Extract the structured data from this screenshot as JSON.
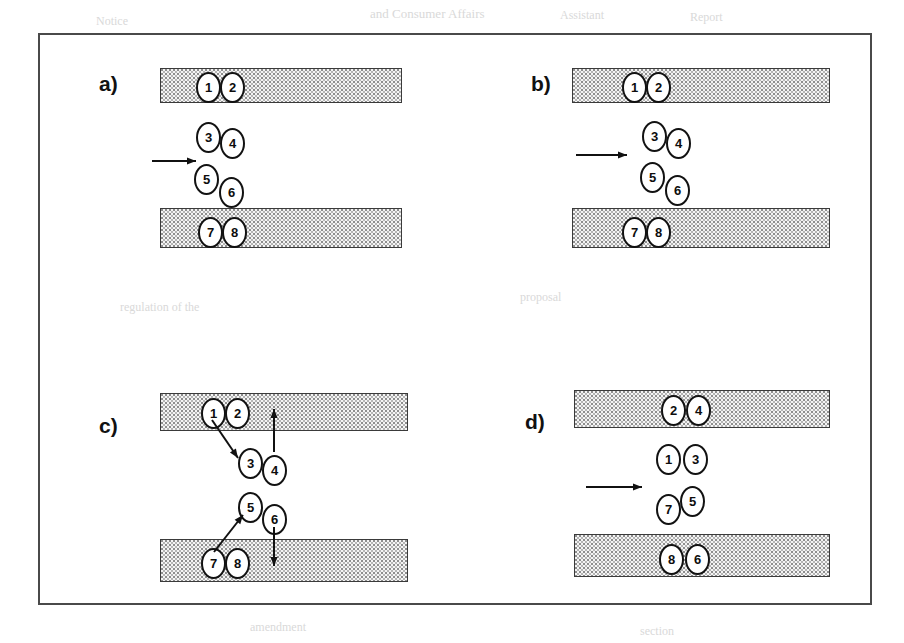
{
  "figure": {
    "type": "schematic-diagram",
    "frame": {
      "x": 38,
      "y": 33,
      "width": 834,
      "height": 572
    }
  },
  "panels": [
    {
      "id": "a",
      "label": "a)",
      "label_pos": {
        "x": 99,
        "y": 72
      },
      "origin": {
        "x": 60,
        "y": 33
      },
      "slabs": [
        {
          "name": "top-slab",
          "x": 160,
          "y": 68,
          "width": 242,
          "height": 35
        },
        {
          "name": "bottom-slab",
          "x": 160,
          "y": 208,
          "width": 242,
          "height": 40
        }
      ],
      "arrow": {
        "name": "shear-arrow",
        "x1": 152,
        "y1": 161,
        "x2": 196,
        "y2": 161
      },
      "nodes": [
        {
          "label": "1",
          "x": 196,
          "y": 72
        },
        {
          "label": "2",
          "x": 220,
          "y": 72
        },
        {
          "label": "3",
          "x": 196,
          "y": 122
        },
        {
          "label": "4",
          "x": 220,
          "y": 128
        },
        {
          "label": "5",
          "x": 194,
          "y": 164
        },
        {
          "label": "6",
          "x": 219,
          "y": 177
        },
        {
          "label": "7",
          "x": 198,
          "y": 217
        },
        {
          "label": "8",
          "x": 222,
          "y": 217
        }
      ],
      "connector_arrows": []
    },
    {
      "id": "b",
      "label": "b)",
      "label_pos": {
        "x": 531,
        "y": 72
      },
      "origin": {
        "x": 492,
        "y": 33
      },
      "slabs": [
        {
          "name": "top-slab",
          "x": 572,
          "y": 68,
          "width": 258,
          "height": 35
        },
        {
          "name": "bottom-slab",
          "x": 572,
          "y": 208,
          "width": 258,
          "height": 40
        }
      ],
      "arrow": {
        "name": "shear-arrow",
        "x1": 576,
        "y1": 155,
        "x2": 627,
        "y2": 155
      },
      "nodes": [
        {
          "label": "1",
          "x": 622,
          "y": 72
        },
        {
          "label": "2",
          "x": 646,
          "y": 72
        },
        {
          "label": "3",
          "x": 642,
          "y": 121
        },
        {
          "label": "4",
          "x": 666,
          "y": 128
        },
        {
          "label": "5",
          "x": 640,
          "y": 162
        },
        {
          "label": "6",
          "x": 665,
          "y": 175
        },
        {
          "label": "7",
          "x": 622,
          "y": 217
        },
        {
          "label": "8",
          "x": 646,
          "y": 217
        }
      ],
      "connector_arrows": []
    },
    {
      "id": "c",
      "label": "c)",
      "label_pos": {
        "x": 99,
        "y": 414
      },
      "origin": {
        "x": 60,
        "y": 390
      },
      "slabs": [
        {
          "name": "top-slab",
          "x": 160,
          "y": 393,
          "width": 248,
          "height": 38
        },
        {
          "name": "bottom-slab",
          "x": 160,
          "y": 539,
          "width": 248,
          "height": 43
        }
      ],
      "arrow": null,
      "nodes": [
        {
          "label": "1",
          "x": 201,
          "y": 398
        },
        {
          "label": "2",
          "x": 225,
          "y": 398
        },
        {
          "label": "3",
          "x": 238,
          "y": 448
        },
        {
          "label": "4",
          "x": 262,
          "y": 455
        },
        {
          "label": "5",
          "x": 238,
          "y": 492
        },
        {
          "label": "6",
          "x": 262,
          "y": 504
        },
        {
          "label": "7",
          "x": 201,
          "y": 548
        },
        {
          "label": "8",
          "x": 225,
          "y": 548
        }
      ],
      "connector_arrows": [
        {
          "name": "arrow-1-to-3",
          "x1": 212,
          "y1": 420,
          "x2": 238,
          "y2": 458
        },
        {
          "name": "arrow-4-up",
          "x1": 274,
          "y1": 452,
          "x2": 274,
          "y2": 409
        },
        {
          "name": "arrow-7-to-5",
          "x1": 214,
          "y1": 552,
          "x2": 243,
          "y2": 515
        },
        {
          "name": "arrow-6-down",
          "x1": 274,
          "y1": 527,
          "x2": 274,
          "y2": 566
        }
      ]
    },
    {
      "id": "d",
      "label": "d)",
      "label_pos": {
        "x": 525,
        "y": 410
      },
      "origin": {
        "x": 492,
        "y": 390
      },
      "slabs": [
        {
          "name": "top-slab",
          "x": 574,
          "y": 390,
          "width": 256,
          "height": 38
        },
        {
          "name": "bottom-slab",
          "x": 574,
          "y": 534,
          "width": 256,
          "height": 43
        }
      ],
      "arrow": {
        "name": "shear-arrow",
        "x1": 586,
        "y1": 487,
        "x2": 642,
        "y2": 487
      },
      "nodes": [
        {
          "label": "2",
          "x": 661,
          "y": 395
        },
        {
          "label": "4",
          "x": 686,
          "y": 395
        },
        {
          "label": "1",
          "x": 656,
          "y": 444
        },
        {
          "label": "3",
          "x": 683,
          "y": 444
        },
        {
          "label": "7",
          "x": 656,
          "y": 494
        },
        {
          "label": "5",
          "x": 680,
          "y": 486
        },
        {
          "label": "8",
          "x": 659,
          "y": 544
        },
        {
          "label": "6",
          "x": 685,
          "y": 544
        }
      ],
      "connector_arrows": []
    }
  ],
  "colors": {
    "frame_border": "#4a4a4a",
    "slab_fill": "#f4f4f4",
    "slab_stipple": "#8e8e8e",
    "slab_border": "#3a3a3a",
    "node_border": "#121212",
    "node_fill": "#ffffff",
    "text": "#0d0d0d"
  },
  "bleed_text": [
    {
      "text": "and Consumer Affairs",
      "x": 370,
      "y": 6,
      "size": 13
    },
    {
      "text": "Assistant",
      "x": 560,
      "y": 8,
      "size": 12
    },
    {
      "text": "Notice",
      "x": 96,
      "y": 14,
      "size": 12
    },
    {
      "text": "Report",
      "x": 690,
      "y": 10,
      "size": 12
    },
    {
      "text": "regulation of the",
      "x": 120,
      "y": 300,
      "size": 12
    },
    {
      "text": "proposal",
      "x": 520,
      "y": 290,
      "size": 12
    },
    {
      "text": "amendment",
      "x": 250,
      "y": 620,
      "size": 12
    },
    {
      "text": "section",
      "x": 640,
      "y": 624,
      "size": 12
    }
  ]
}
